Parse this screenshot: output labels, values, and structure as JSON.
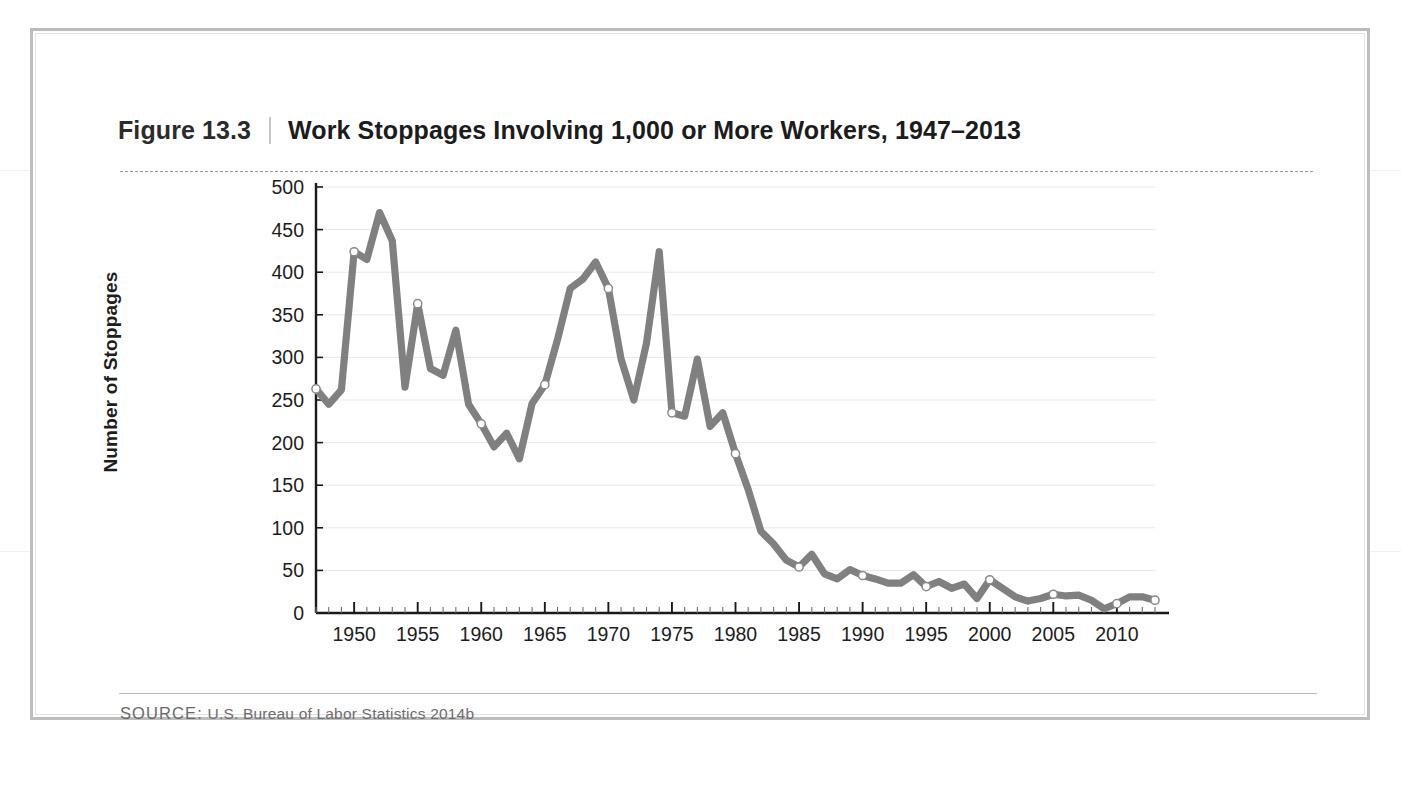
{
  "figure": {
    "number": "Figure 13.3",
    "divider": "|",
    "title": "Work Stoppages Involving 1,000 or More Workers, 1947–2013"
  },
  "source": {
    "label": "SOURCE:",
    "text": " U.S. Bureau of Labor Statistics 2014b"
  },
  "colors": {
    "line": "#808080",
    "marker_fill": "#ffffff",
    "marker_stroke": "#8a8a8a",
    "axis": "#1a1a1a",
    "gridline": "#e8e8e8",
    "frame_outer": "#bdbdbd",
    "frame_inner": "#e2e2e2",
    "title_text": "#1c1c1c",
    "source_text": "#6d6d6d"
  },
  "chart_data": {
    "type": "line",
    "title": "Work Stoppages Involving 1,000 or More Workers, 1947–2013",
    "xlabel": "",
    "ylabel": "Number of Stoppages",
    "xlim": [
      1947,
      2013
    ],
    "ylim": [
      0,
      500
    ],
    "ytick_labels": [
      "0",
      "50",
      "100",
      "150",
      "200",
      "250",
      "300",
      "350",
      "400",
      "450",
      "500"
    ],
    "ytick_values": [
      0,
      50,
      100,
      150,
      200,
      250,
      300,
      350,
      400,
      450,
      500
    ],
    "ytick_interval": 50,
    "xtick_labels": [
      "1950",
      "1955",
      "1960",
      "1965",
      "1970",
      "1975",
      "1980",
      "1985",
      "1990",
      "1995",
      "2000",
      "2005",
      "2010"
    ],
    "xtick_values": [
      1950,
      1955,
      1960,
      1965,
      1970,
      1975,
      1980,
      1985,
      1990,
      1995,
      2000,
      2005,
      2010
    ],
    "xtick_minor_interval": 1,
    "grid": "horizontal",
    "legend": "none",
    "marker_years": [
      1947,
      1950,
      1955,
      1960,
      1965,
      1970,
      1975,
      1980,
      1985,
      1990,
      1995,
      2000,
      2005,
      2010,
      2013
    ],
    "x": [
      1947,
      1948,
      1949,
      1950,
      1951,
      1952,
      1953,
      1954,
      1955,
      1956,
      1957,
      1958,
      1959,
      1960,
      1961,
      1962,
      1963,
      1964,
      1965,
      1966,
      1967,
      1968,
      1969,
      1970,
      1971,
      1972,
      1973,
      1974,
      1975,
      1976,
      1977,
      1978,
      1979,
      1980,
      1981,
      1982,
      1983,
      1984,
      1985,
      1986,
      1987,
      1988,
      1989,
      1990,
      1991,
      1992,
      1993,
      1994,
      1995,
      1996,
      1997,
      1998,
      1999,
      2000,
      2001,
      2002,
      2003,
      2004,
      2005,
      2006,
      2007,
      2008,
      2009,
      2010,
      2011,
      2012,
      2013
    ],
    "y": [
      263,
      245,
      262,
      424,
      415,
      470,
      437,
      265,
      363,
      287,
      279,
      332,
      245,
      222,
      195,
      211,
      181,
      246,
      268,
      321,
      381,
      392,
      412,
      381,
      298,
      250,
      317,
      424,
      235,
      231,
      298,
      219,
      235,
      187,
      145,
      96,
      81,
      62,
      54,
      69,
      46,
      40,
      51,
      44,
      40,
      35,
      35,
      45,
      31,
      37,
      29,
      34,
      17,
      39,
      29,
      19,
      14,
      17,
      22,
      20,
      21,
      15,
      5,
      11,
      19,
      19,
      15
    ],
    "series_name": "Work stoppages involving 1,000 or more workers",
    "notable": {
      "peak_year": 1952,
      "peak_value": 470,
      "min_year": 2009,
      "min_value": 5,
      "last_year": 2013,
      "last_value": 15
    }
  }
}
